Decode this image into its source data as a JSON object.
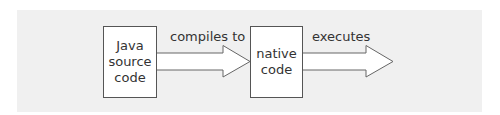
{
  "diagram": {
    "background_color": "#f0f0f0",
    "nodes": [
      {
        "id": "java-source",
        "label": "Java\nsource\ncode"
      },
      {
        "id": "native-code",
        "label": "native\ncode"
      }
    ],
    "edges": [
      {
        "from": "java-source",
        "to": "native-code",
        "label": "compiles to"
      },
      {
        "from": "native-code",
        "to": "execution",
        "label": "executes"
      }
    ],
    "colors": {
      "panel": "#f0f0f0",
      "box_fill": "#ffffff",
      "stroke": "#555555",
      "text": "#333333"
    }
  }
}
